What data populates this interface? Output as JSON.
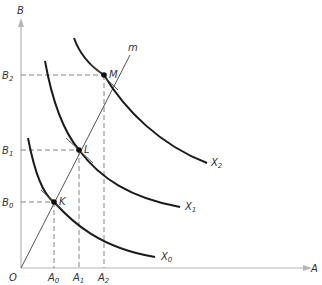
{
  "diagram": {
    "axes": {
      "y_label": "B",
      "x_label": "A",
      "origin_label": "O",
      "axis_color": "#b5b5b5"
    },
    "ray": {
      "label": "m"
    },
    "points": [
      {
        "label": "K",
        "a_tick": "A",
        "a_sub": "0",
        "b_tick": "B",
        "b_sub": "0",
        "curve": "X",
        "curve_sub": "0"
      },
      {
        "label": "L",
        "a_tick": "A",
        "a_sub": "1",
        "b_tick": "B",
        "b_sub": "1",
        "curve": "X",
        "curve_sub": "1"
      },
      {
        "label": "M",
        "a_tick": "A",
        "a_sub": "2",
        "b_tick": "B",
        "b_sub": "2",
        "curve": "X",
        "curve_sub": "2"
      }
    ],
    "colors": {
      "curve": "#1a1a1a",
      "guide": "#666666",
      "text": "#333333"
    }
  }
}
